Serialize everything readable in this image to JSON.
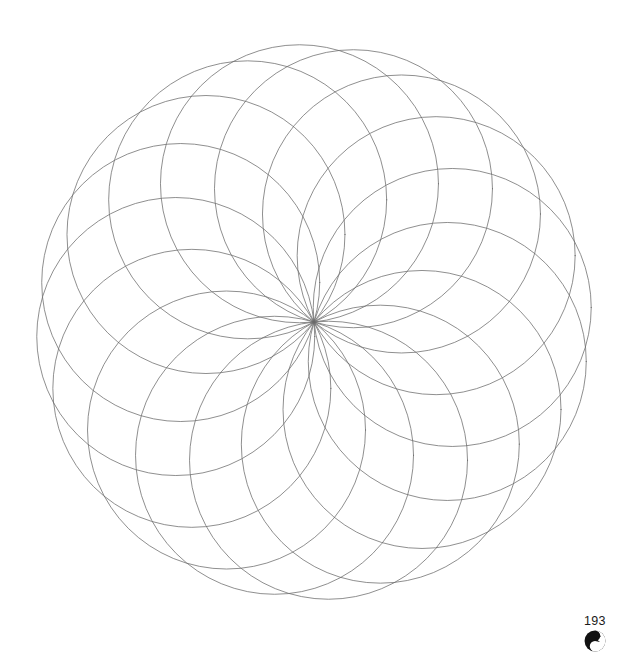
{
  "page": {
    "number": "193",
    "background_color": "#ffffff",
    "width": 633,
    "height": 655
  },
  "logo": {
    "name": "yin-yang-logo",
    "color": "#111111",
    "background": "#ffffff"
  },
  "artwork": {
    "title": "Spiral rosette mandala",
    "description": "Rosette of equal-radius circles all passing through a shared centre point, evenly rotated to form a pinwheel of cusped petals",
    "stroke_color": "#6a6a6a",
    "stroke_width": 0.75,
    "fill": "none"
  },
  "chart_data": {
    "type": "scatter",
    "xlabel": "",
    "ylabel": "",
    "grid": false,
    "legend": null,
    "geometry": {
      "center_x": 314,
      "center_y": 322,
      "circle_radius": 139,
      "orbit_radius": 139,
      "circle_count": 16,
      "start_angle_deg": -96,
      "sweep_deg": 360,
      "viewbox": [
        0,
        0,
        633,
        620
      ]
    },
    "circle_centers_deg": [
      -96,
      -73.5,
      -51,
      -28.5,
      -6,
      16.5,
      39,
      61.5,
      84,
      106.5,
      129,
      151.5,
      174,
      196.5,
      219,
      241.5
    ],
    "bounds": {
      "x_min": 35,
      "x_max": 593,
      "y_min": 37,
      "y_max": 602
    }
  }
}
